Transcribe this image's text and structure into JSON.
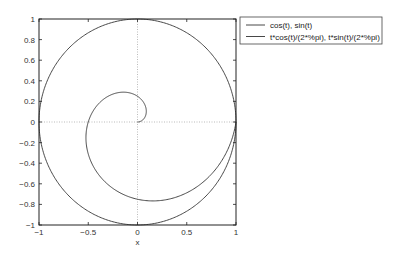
{
  "chart_data": {
    "type": "line",
    "title": "",
    "xlabel": "x",
    "ylabel": "",
    "xlim": [
      -1,
      1
    ],
    "ylim": [
      -1,
      1
    ],
    "xticks": [
      -1,
      -0.5,
      0,
      0.5,
      1
    ],
    "xtick_labels": [
      "−1",
      "−0.5",
      "0",
      "0.5",
      "1"
    ],
    "yticks": [
      -1,
      -0.8,
      -0.6,
      -0.4,
      -0.2,
      0,
      0.2,
      0.4,
      0.6,
      0.8,
      1
    ],
    "ytick_labels": [
      "−1",
      "−0.8",
      "−0.6",
      "−0.4",
      "−0.2",
      "0",
      "0.2",
      "0.4",
      "0.6",
      "0.8",
      "1"
    ],
    "grid": "zero-lines-dotted",
    "legend_position": "outside-top-right",
    "series": [
      {
        "name": "cos(t), sin(t)",
        "parametric": "x = cos(t), y = sin(t)",
        "t_range": [
          0,
          6.2832
        ],
        "color": "#333333"
      },
      {
        "name": "t*cos(t)/(2*%pi), t*sin(t)/(2*%pi)",
        "parametric": "x = t*cos(t)/(2*pi), y = t*sin(t)/(2*pi)",
        "t_range": [
          0,
          6.2832
        ],
        "color": "#333333"
      }
    ]
  }
}
